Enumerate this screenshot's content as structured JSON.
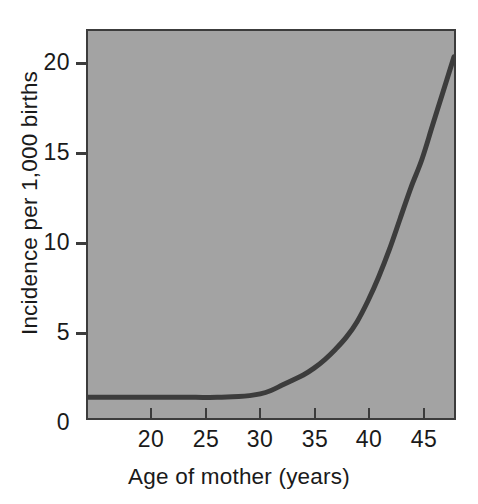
{
  "chart_data": {
    "type": "line",
    "title": "",
    "subtitle": "",
    "xlabel": "Age of mother (years)",
    "ylabel": "Incidence per 1,000 births",
    "xlim": [
      14,
      48
    ],
    "ylim": [
      0,
      22.5
    ],
    "xticks": [
      20,
      25,
      30,
      35,
      40,
      45
    ],
    "xtick_labels": [
      "20",
      "25",
      "30",
      "35",
      "40",
      "45"
    ],
    "yticks": [
      0,
      5,
      10,
      15,
      20
    ],
    "ytick_labels": [
      "0",
      "5",
      "10",
      "15",
      "20"
    ],
    "grid": false,
    "legend": "none",
    "annotations": [],
    "series": [
      {
        "name": "Incidence",
        "color": "#3c3c3c",
        "x": [
          14,
          16,
          18,
          20,
          22,
          24,
          26,
          28,
          29,
          30,
          31,
          32,
          33,
          34,
          35,
          36,
          37,
          38,
          39,
          40,
          41,
          42,
          43,
          44,
          45,
          46,
          47,
          48
        ],
        "values": [
          1.2,
          1.2,
          1.2,
          1.2,
          1.2,
          1.2,
          1.2,
          1.25,
          1.3,
          1.4,
          1.6,
          1.9,
          2.2,
          2.5,
          2.9,
          3.4,
          4.0,
          4.7,
          5.6,
          6.8,
          8.2,
          9.8,
          11.6,
          13.4,
          15.0,
          17.0,
          19.0,
          21.0
        ]
      }
    ]
  },
  "axes": {
    "y_title": "Incidence per 1,000 births",
    "x_title": "Age of mother (years)",
    "y_labels": [
      "20",
      "15",
      "10",
      "5",
      "0"
    ],
    "x_labels": [
      "20",
      "25",
      "30",
      "35",
      "40",
      "45"
    ]
  },
  "colors": {
    "panel_background": "#a3a3a3",
    "line": "#3c3c3c",
    "axis": "#3c3c3c",
    "text": "#1a1a1a",
    "page_background": "#ffffff"
  }
}
